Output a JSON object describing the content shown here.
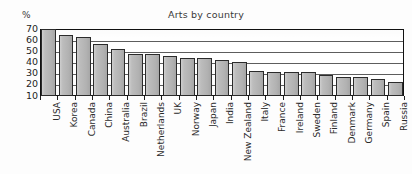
{
  "chart_data": {
    "type": "bar",
    "title": "Arts by country",
    "xlabel": "",
    "ylabel": "%",
    "unit_label": "%",
    "ylim": [
      10,
      70
    ],
    "ytick_labels": [
      "70",
      "60",
      "50",
      "40",
      "30",
      "20",
      "10"
    ],
    "yticks": [
      70,
      60,
      50,
      40,
      30,
      20,
      10
    ],
    "grid": true,
    "grid_axis": "y",
    "legend": "none",
    "categories": [
      "USA",
      "Korea",
      "Canada",
      "China",
      "Australia",
      "Brazil",
      "Netherlands",
      "UK",
      "Norway",
      "Japan",
      "India",
      "New Zealand",
      "Italy",
      "France",
      "Ireland",
      "Sweden",
      "Finland",
      "Denmark",
      "Germany",
      "Spain",
      "Russia"
    ],
    "values": [
      70,
      64,
      62,
      56,
      52,
      47,
      47,
      45,
      44,
      44,
      42,
      40,
      32,
      31,
      31,
      31,
      28,
      27,
      27,
      25,
      22
    ],
    "series": [
      {
        "name": "Arts participation",
        "values": [
          70,
          64,
          62,
          56,
          52,
          47,
          47,
          45,
          44,
          44,
          42,
          40,
          32,
          31,
          31,
          31,
          28,
          27,
          27,
          25,
          22
        ]
      }
    ],
    "colors": {
      "bar_fill": "#b9b9b9",
      "bar_stroke": "#2b2b2b",
      "frame": "#111111",
      "gridline": "#5d5d5d",
      "text": "#2a2a2a"
    }
  }
}
